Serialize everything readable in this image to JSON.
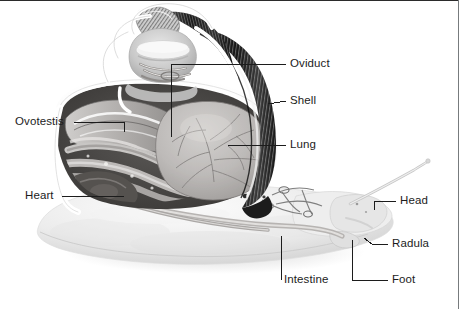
{
  "figure": {
    "title": "",
    "background_color": "#ffffff",
    "label_color": "#1c1c1c",
    "leader_color": "#1c1c1c",
    "border_color": "#2b2b2b"
  },
  "labels": [
    {
      "id": "oviduct",
      "text": "Oviduct",
      "x": 290,
      "y": 64
    },
    {
      "id": "shell",
      "text": "Shell",
      "x": 290,
      "y": 101
    },
    {
      "id": "lung",
      "text": "Lung",
      "x": 290,
      "y": 141
    },
    {
      "id": "head",
      "text": "Head",
      "x": 400,
      "y": 198
    },
    {
      "id": "radula",
      "text": "Radula",
      "x": 392,
      "y": 241
    },
    {
      "id": "foot",
      "text": "Foot",
      "x": 392,
      "y": 276
    },
    {
      "id": "ovotestis",
      "text": "Ovotestis",
      "x": 18,
      "y": 118
    },
    {
      "id": "heart",
      "text": "Heart",
      "x": 25,
      "y": 192
    },
    {
      "id": "intestine",
      "text": "Intestine",
      "x": 285,
      "y": 276
    }
  ],
  "parts": [
    "Oviduct",
    "Shell",
    "Lung",
    "Head",
    "Radula",
    "Foot",
    "Ovotestis",
    "Heart",
    "Intestine"
  ]
}
